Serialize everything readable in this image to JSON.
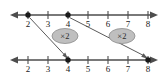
{
  "figure": {
    "background_color": "#ffffff",
    "line_color": "#4d4d4d",
    "text_color": "#1a1a1a",
    "oval_fill": "#bfbfbf",
    "oval_stroke": "#8c8c8c",
    "connector_color": "#5a5a5a"
  },
  "top_number_line": {
    "name": "top-number-line",
    "y": 15,
    "left_arrow": true,
    "right_arrow": true,
    "tick_labels": [
      "2",
      "3",
      "4",
      "5",
      "6",
      "7",
      "8"
    ],
    "tick_values": [
      2,
      3,
      4,
      5,
      6,
      7,
      8
    ],
    "tick_x": [
      28,
      48,
      68,
      88,
      108,
      128,
      148
    ],
    "marked_points": [
      {
        "label": "2",
        "value": 2,
        "x": 28
      },
      {
        "label": "4",
        "value": 4,
        "x": 68
      }
    ]
  },
  "bottom_number_line": {
    "name": "bottom-number-line",
    "y": 60,
    "left_arrow": true,
    "right_arrow": true,
    "tick_labels": [
      "2",
      "3",
      "4",
      "5",
      "6",
      "7",
      "8"
    ],
    "tick_values": [
      2,
      3,
      4,
      5,
      6,
      7,
      8
    ],
    "tick_x": [
      28,
      48,
      68,
      88,
      108,
      128,
      148
    ],
    "marked_points": [
      {
        "label": "4",
        "value": 4,
        "x": 68
      },
      {
        "label": "8",
        "value": 8,
        "x": 148
      }
    ]
  },
  "mappings": [
    {
      "name": "mapping-2-to-4",
      "from_value": 2,
      "to_value": 4,
      "from_x": 28,
      "to_x": 68,
      "operation_label": "×2",
      "oval_center_x": 65,
      "oval_center_y": 36
    },
    {
      "name": "mapping-4-to-8",
      "from_value": 4,
      "to_value": 8,
      "from_x": 68,
      "to_x": 148,
      "operation_label": "×2",
      "oval_center_x": 122,
      "oval_center_y": 36
    }
  ]
}
